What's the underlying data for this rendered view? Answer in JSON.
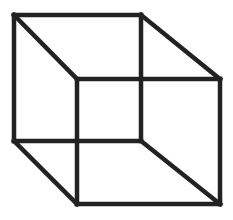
{
  "figure": {
    "type": "necker-cube",
    "stroke_color": "#222222",
    "stroke_width": 4.5,
    "background": "#ffffff",
    "vertices": {
      "back_top_left": [
        14,
        15
      ],
      "back_top_right": [
        141,
        15
      ],
      "back_bottom_left": [
        14,
        141
      ],
      "back_bottom_right": [
        141,
        141
      ],
      "front_top_left": [
        77,
        79
      ],
      "front_top_right": [
        220,
        79
      ],
      "front_bottom_left": [
        77,
        204
      ],
      "front_bottom_right": [
        220,
        204
      ]
    },
    "edges": [
      [
        "back_top_left",
        "back_top_right"
      ],
      [
        "back_top_right",
        "back_bottom_right"
      ],
      [
        "back_bottom_right",
        "back_bottom_left"
      ],
      [
        "back_bottom_left",
        "back_top_left"
      ],
      [
        "front_top_left",
        "front_top_right"
      ],
      [
        "front_top_right",
        "front_bottom_right"
      ],
      [
        "front_bottom_right",
        "front_bottom_left"
      ],
      [
        "front_bottom_left",
        "front_top_left"
      ],
      [
        "back_top_left",
        "front_top_left"
      ],
      [
        "back_top_right",
        "front_top_right"
      ],
      [
        "back_bottom_left",
        "front_bottom_left"
      ],
      [
        "back_bottom_right",
        "front_bottom_right"
      ]
    ]
  }
}
